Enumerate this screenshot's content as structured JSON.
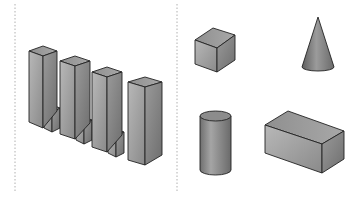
{
  "figure": {
    "panels": [
      {
        "name": "left-panel",
        "content": "bar-blocks",
        "bars": 4,
        "small_blocks": 3
      },
      {
        "name": "right-panel",
        "shapes": [
          "cube",
          "cone",
          "cylinder",
          "rectangular-prism"
        ]
      }
    ],
    "colors": {
      "fill_light": "#bdbdbd",
      "fill_mid": "#9e9e9e",
      "fill_dark": "#7a7a7a",
      "outline": "#222222",
      "separator": "#b0b0b0"
    }
  }
}
